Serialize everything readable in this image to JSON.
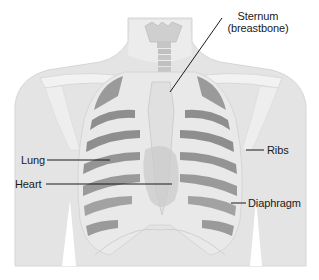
{
  "diagram": {
    "colors": {
      "background": "#ffffff",
      "skin": "#e4e4e4",
      "skin_edge": "#d6d6d6",
      "bone": "#eeeeee",
      "bone_shadow": "#cfcfcf",
      "lung_dark": "#8e8e8e",
      "lung_mid": "#ababab",
      "heart": "#c9c9c9",
      "leader_line": "#1a1a1a",
      "label_text": "#1a1a1a"
    },
    "labels": {
      "sternum_line1": "Sternum",
      "sternum_line2": "(breastbone)",
      "lung": "Lung",
      "heart": "Heart",
      "ribs": "Ribs",
      "diaphragm": "Diaphragm"
    }
  }
}
